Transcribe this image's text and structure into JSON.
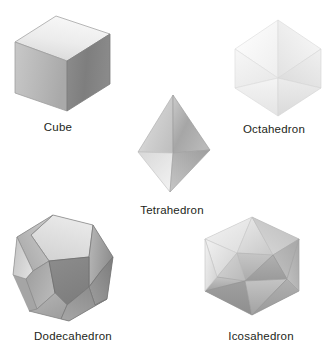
{
  "figure": {
    "title": "",
    "background_color": "#ffffff",
    "label_color": "#231f20",
    "solids": [
      {
        "name": "cube",
        "label": "Cube",
        "faces": 6,
        "face_shape": "square",
        "shading": {
          "top": "#e8e8e8",
          "left": "#b4b4b4",
          "right": "#808080",
          "outline": "#9a9a9a"
        }
      },
      {
        "name": "octahedron",
        "label": "Octahedron",
        "faces": 8,
        "face_shape": "triangle",
        "shading": {
          "top": "#fbfbfb",
          "left": "#f2f2f2",
          "right": "#e6e6e6",
          "outline": "#dcdcdc"
        }
      },
      {
        "name": "tetrahedron",
        "label": "Tetrahedron",
        "faces": 4,
        "face_shape": "triangle",
        "shading": {
          "top": "#d6d6d6",
          "left": "#c4c4c4",
          "right": "#9e9e9e",
          "outline": "#a8a8a8"
        }
      },
      {
        "name": "dodecahedron",
        "label": "Dodecahedron",
        "faces": 12,
        "face_shape": "pentagon",
        "shading": {
          "top": "#e2e2e2",
          "left": "#b0b0b0",
          "right": "#888888",
          "outline": "#8f8f8f"
        }
      },
      {
        "name": "icosahedron",
        "label": "Icosahedron",
        "faces": 20,
        "face_shape": "triangle",
        "shading": {
          "top": "#ededed",
          "left": "#c9c9c9",
          "right": "#a0a0a0",
          "outline": "#a9a9a9"
        }
      }
    ]
  }
}
